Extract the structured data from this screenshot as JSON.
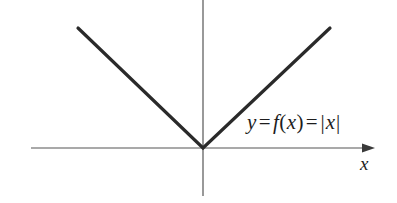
{
  "figure": {
    "background_color": "#ffffff",
    "axis_color": "#555555",
    "curve_color": "#2a2a2a"
  },
  "labels": {
    "equation": {
      "full_text": "y = f(x) = |x|",
      "y": "y",
      "equals_1": "=",
      "f": "f",
      "open_paren": "(",
      "x_arg": "x",
      "close_paren": ")",
      "equals_2": "=",
      "bar_left": "|",
      "x_abs": "x",
      "bar_right": "|"
    },
    "x_axis": "x"
  },
  "chart_data": {
    "type": "line",
    "xlabel": "x",
    "ylabel": "",
    "grid": false,
    "legend": false,
    "annotations": [
      {
        "text": "y = f(x) = |x|",
        "x_px": 247,
        "y_px": 130
      },
      {
        "text": "x",
        "x_px": 365,
        "y_px": 167
      }
    ],
    "origin_px": {
      "x": 203,
      "y": 148
    },
    "axes": {
      "x_axis": {
        "start_px": {
          "x": 31,
          "y": 148
        },
        "end_px": {
          "x": 375,
          "y": 148
        },
        "arrow": "right"
      },
      "y_axis": {
        "start_px": {
          "x": 203,
          "y": 0
        },
        "end_px": {
          "x": 203,
          "y": 196
        },
        "arrow": "none"
      }
    },
    "series": [
      {
        "name": "y = |x|",
        "points_px": [
          {
            "x": 78,
            "y": 28
          },
          {
            "x": 203,
            "y": 148
          },
          {
            "x": 330,
            "y": 28
          }
        ]
      }
    ]
  }
}
